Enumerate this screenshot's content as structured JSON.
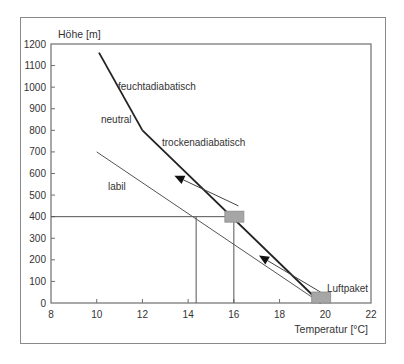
{
  "chart_data": {
    "type": "line",
    "title": "",
    "xlabel": "Temperatur [°C]",
    "ylabel": "Höhe [m]",
    "xlim": [
      8,
      22
    ],
    "ylim": [
      0,
      1200
    ],
    "x_ticks": [
      8,
      10,
      12,
      14,
      16,
      18,
      20,
      22
    ],
    "y_ticks": [
      0,
      100,
      200,
      300,
      400,
      500,
      600,
      700,
      800,
      900,
      1000,
      1100,
      1200
    ],
    "grid": false,
    "series": [
      {
        "name": "trockenadiabatisch",
        "style": "thick",
        "points": [
          [
            19.8,
            0
          ],
          [
            12.0,
            800
          ]
        ]
      },
      {
        "name": "feuchtadiabatisch",
        "style": "thick",
        "points": [
          [
            12.0,
            800
          ],
          [
            10.1,
            1160
          ]
        ]
      },
      {
        "name": "labil",
        "style": "thin",
        "points": [
          [
            19.8,
            0
          ],
          [
            10.0,
            700
          ]
        ]
      }
    ],
    "reference_lines": [
      {
        "name": "400m-horizontal",
        "points": [
          [
            8,
            400
          ],
          [
            16,
            400
          ]
        ]
      },
      {
        "name": "vertical-14.3",
        "points": [
          [
            14.35,
            0
          ],
          [
            14.35,
            400
          ]
        ]
      },
      {
        "name": "vertical-16",
        "points": [
          [
            16,
            0
          ],
          [
            16,
            400
          ]
        ]
      }
    ],
    "markers": [
      {
        "name": "Luftpaket",
        "shape": "rectangle",
        "x": 19.8,
        "y": 0,
        "color": "#a6a6a6"
      },
      {
        "name": "Luftpaket-400m",
        "shape": "rectangle",
        "x": 16.0,
        "y": 400,
        "color": "#a6a6a6"
      }
    ],
    "arrows": [
      {
        "from": [
          19.8,
          50
        ],
        "to": [
          17.1,
          220
        ]
      },
      {
        "from": [
          16.2,
          450
        ],
        "to": [
          13.4,
          590
        ]
      }
    ],
    "annotations": [
      {
        "text": "feuchtadiabatisch",
        "x": 11.0,
        "y": 1010
      },
      {
        "text": "neutral",
        "x": 10.3,
        "y": 830
      },
      {
        "text": "trockenadiabatisch",
        "x": 13.6,
        "y": 750
      },
      {
        "text": "labil",
        "x": 10.8,
        "y": 560
      },
      {
        "text": "Luftpaket",
        "x": 20.3,
        "y": 50
      }
    ]
  },
  "labels": {
    "ylabel": "Höhe [m]",
    "xlabel": "Temperatur [°C]",
    "feucht": "feuchtadiabatisch",
    "neutral": "neutral",
    "trocken": "trockenadiabatisch",
    "labil": "labil",
    "luftpaket": "Luftpaket"
  },
  "colors": {
    "line": "#222222",
    "thin_line": "#555555",
    "box": "#a6a6a6",
    "frame": "#8a8a8a"
  }
}
